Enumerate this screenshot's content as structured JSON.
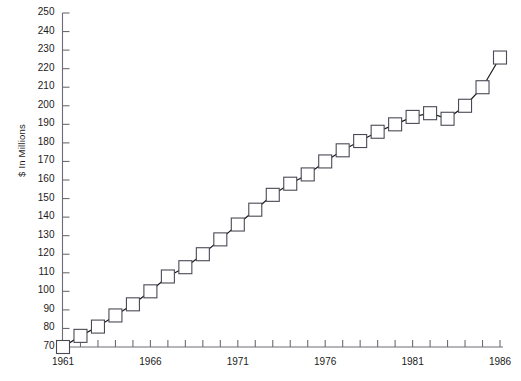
{
  "chart_data": {
    "type": "line",
    "title": "",
    "subtitle": "",
    "xlabel": "",
    "ylabel": "$ In Millions",
    "xlim": [
      1961,
      1986
    ],
    "ylim": [
      70,
      250
    ],
    "ytick_step": 10,
    "xtick_step": 1,
    "grid": false,
    "legend": "none",
    "marker": "open-square",
    "line_color": "#1a1a1a",
    "marker_fill": "#ffffff",
    "marker_stroke": "#4a4a56",
    "ytick_labels": [
      "250",
      "240",
      "230",
      "220",
      "210",
      "200",
      "190",
      "180",
      "170",
      "160",
      "150",
      "140",
      "130",
      "120",
      "110",
      "100",
      "90",
      "80",
      "70"
    ],
    "xtick_labels": [
      "1961",
      "1966",
      "1971",
      "1976",
      "1981",
      "1986"
    ],
    "xtick_label_years": [
      1961,
      1966,
      1971,
      1976,
      1981,
      1986
    ],
    "x": [
      1961,
      1962,
      1963,
      1964,
      1965,
      1966,
      1967,
      1968,
      1969,
      1970,
      1971,
      1972,
      1973,
      1974,
      1975,
      1976,
      1977,
      1978,
      1979,
      1980,
      1981,
      1982,
      1983,
      1984,
      1985,
      1986
    ],
    "values": [
      70,
      76,
      81,
      87,
      93,
      100,
      108,
      113,
      120,
      128,
      136,
      144,
      152,
      158,
      163,
      170,
      176,
      181,
      186,
      190,
      194,
      196,
      193,
      200,
      210,
      226
    ],
    "series": [
      {
        "name": "$ In Millions",
        "values": [
          70,
          76,
          81,
          87,
          93,
          100,
          108,
          113,
          120,
          128,
          136,
          144,
          152,
          158,
          163,
          170,
          176,
          181,
          186,
          190,
          194,
          196,
          193,
          200,
          210,
          226
        ]
      }
    ],
    "annotations": []
  },
  "axis": {
    "y_axis_label": "$ In Millions"
  }
}
